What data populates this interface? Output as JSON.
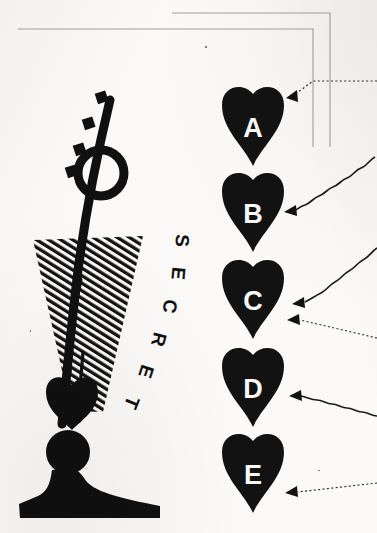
{
  "page": {
    "background_color": "#fbfaf8",
    "ink_color": "#111111",
    "width": 377,
    "height": 533
  },
  "illustration": {
    "name": "desk-lamp-with-secret-light-cone",
    "label_text": "SECRET",
    "label_letters": [
      "S",
      "E",
      "C",
      "R",
      "E",
      "T"
    ],
    "parts": [
      "lamp-arm",
      "lamp-loop",
      "lamp-shade",
      "lamp-neck-ball",
      "lamp-base",
      "light-cone-hatched",
      "dash-marks"
    ],
    "hatch_color": "#121212"
  },
  "hearts": [
    {
      "letter": "A",
      "arrow_style": "dotted",
      "arrow_count": 1
    },
    {
      "letter": "B",
      "arrow_style": "wavy",
      "arrow_count": 1
    },
    {
      "letter": "C",
      "arrow_style": "wavy-and-dotted",
      "arrow_count": 2
    },
    {
      "letter": "D",
      "arrow_style": "wavy",
      "arrow_count": 1
    },
    {
      "letter": "E",
      "arrow_style": "dotted",
      "arrow_count": 1
    }
  ],
  "frame": {
    "line_color": "#9a9a9a",
    "lines": [
      "inner-bracket",
      "outer-bracket"
    ]
  }
}
